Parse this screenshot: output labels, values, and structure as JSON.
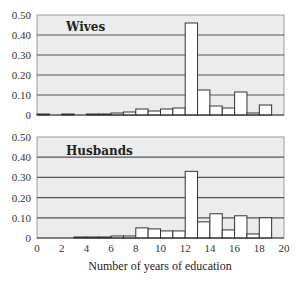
{
  "chart_data": [
    {
      "type": "bar",
      "title": "Wives",
      "xlabel": "",
      "ylabel": "",
      "x": [
        0,
        1,
        2,
        3,
        4,
        5,
        6,
        7,
        8,
        9,
        10,
        11,
        12,
        13,
        14,
        15,
        16,
        17,
        18,
        19
      ],
      "values": [
        0.005,
        0,
        0.005,
        0,
        0.005,
        0.005,
        0.01,
        0.015,
        0.03,
        0.02,
        0.03,
        0.035,
        0.46,
        0.125,
        0.045,
        0.035,
        0.115,
        0.01,
        0.05,
        0
      ],
      "ylim": [
        0,
        0.5
      ],
      "xlim": [
        0,
        20
      ],
      "yticks": [
        "0",
        "0.10",
        "0.20",
        "0.30",
        "0.40",
        "0.50"
      ],
      "grid": true
    },
    {
      "type": "bar",
      "title": "Husbands",
      "xlabel": "Number of years of education",
      "ylabel": "",
      "x": [
        0,
        1,
        2,
        3,
        4,
        5,
        6,
        7,
        8,
        9,
        10,
        11,
        12,
        13,
        14,
        15,
        16,
        17,
        18,
        19
      ],
      "values": [
        0,
        0,
        0,
        0.005,
        0.005,
        0.005,
        0.01,
        0.01,
        0.05,
        0.045,
        0.035,
        0.035,
        0.33,
        0.08,
        0.12,
        0.04,
        0.11,
        0.02,
        0.1,
        0
      ],
      "ylim": [
        0,
        0.5
      ],
      "xlim": [
        0,
        20
      ],
      "yticks": [
        "0",
        "0.10",
        "0.20",
        "0.30",
        "0.40",
        "0.50"
      ],
      "xticks": [
        "0",
        "2",
        "4",
        "6",
        "8",
        "10",
        "12",
        "14",
        "16",
        "18",
        "20"
      ],
      "grid": true
    }
  ],
  "panels": {
    "top_label": "Wives",
    "bottom_label": "Husbands"
  },
  "axis": {
    "xlabel": "Number of years of education",
    "yticks": [
      "0",
      "0.10",
      "0.20",
      "0.30",
      "0.40",
      "0.50"
    ],
    "xticks": [
      "0",
      "2",
      "4",
      "6",
      "8",
      "10",
      "12",
      "14",
      "16",
      "18",
      "20"
    ]
  },
  "colors": {
    "plot_bg": "#ececec",
    "grid": "#555555",
    "bar_fill": "#ffffff",
    "bar_stroke": "#333333"
  }
}
